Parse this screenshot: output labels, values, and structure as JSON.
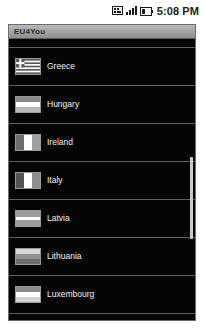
{
  "status_bar": {
    "clock": "5:08 PM",
    "icons": [
      {
        "name": "sd-card-icon",
        "label": "SD card"
      },
      {
        "name": "signal-bars-icon",
        "label": "Signal strength"
      },
      {
        "name": "battery-icon",
        "label": "Battery"
      }
    ]
  },
  "app": {
    "title": "EU4You"
  },
  "list": {
    "partial_top_row": {
      "label": ""
    },
    "items": [
      {
        "label": "Greece",
        "flag_name": "flag-greece",
        "flag_type": "greece",
        "colors": [
          "#3f6fb5",
          "#ffffff"
        ]
      },
      {
        "label": "Hungary",
        "flag_name": "flag-hungary",
        "flag_type": "horizontal-3",
        "colors": [
          "#8a8a8a",
          "#ffffff",
          "#b7b7b7"
        ]
      },
      {
        "label": "Ireland",
        "flag_name": "flag-ireland",
        "flag_type": "vertical-3",
        "colors": [
          "#6e6e6e",
          "#ffffff",
          "#a0a0a0"
        ]
      },
      {
        "label": "Italy",
        "flag_name": "flag-italy",
        "flag_type": "vertical-3",
        "colors": [
          "#545454",
          "#ffffff",
          "#8c8c8c"
        ]
      },
      {
        "label": "Latvia",
        "flag_name": "flag-latvia",
        "flag_type": "horizontal-3",
        "colors": [
          "#9b9b9b",
          "#ffffff",
          "#9b9b9b"
        ]
      },
      {
        "label": "Lithuania",
        "flag_name": "flag-lithuania",
        "flag_type": "horizontal-3",
        "colors": [
          "#d6d6d6",
          "#8f8f8f",
          "#6d6d6d"
        ]
      },
      {
        "label": "Luxembourg",
        "flag_name": "flag-luxembourg",
        "flag_type": "horizontal-3",
        "colors": [
          "#8b8b8b",
          "#ffffff",
          "#d2d2d2"
        ]
      }
    ]
  },
  "scrollbar": {
    "name": "vertical-scrollbar",
    "thumb_top_px": 118,
    "thumb_height_px": 82
  },
  "colors": {
    "background": "#000000",
    "title_bar": "#a7a7a7",
    "row_divider": "#5f5f5f",
    "text": "#f2f2f2",
    "scroll_thumb": "#c9c9c9"
  }
}
